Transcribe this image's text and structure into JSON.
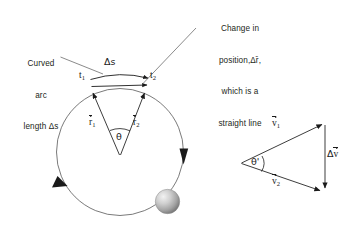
{
  "figure": {
    "background_color": "#ffffff",
    "ink_color": "#231f20",
    "line_color": "#4d4d4d",
    "sphere_color": "#a8a8a8"
  },
  "annotations": {
    "arc_label": {
      "lines": [
        "Curved",
        "arc",
        "length Δs"
      ],
      "line1": "Curved",
      "line2": "arc",
      "line3": "length Δs"
    },
    "displacement_label": {
      "lines": [
        "Change in",
        "position,Δr̄,",
        "which is a",
        "straight line"
      ],
      "line1": "Change in",
      "line2": "position,Δr̄,",
      "line3": "which is a",
      "line4": "straight line"
    }
  },
  "circle_diagram": {
    "name": "circular-path-diagram",
    "arc_length_label": "Δs",
    "time_1_label": "t",
    "time_1_sub": "1",
    "time_2_label": "t",
    "time_2_sub": "2",
    "radius_1_label": "r",
    "radius_1_sub": "1",
    "radius_2_label": "r",
    "radius_2_sub": "2",
    "angle_label": "θ",
    "direction_arrows": 2,
    "particle": "ball"
  },
  "vector_triangle": {
    "name": "velocity-vector-triangle",
    "v1_label": "v",
    "v1_sub": "1",
    "v2_label": "v",
    "v2_sub": "2",
    "delta_v_label": "Δv",
    "angle_label": "θ'"
  }
}
